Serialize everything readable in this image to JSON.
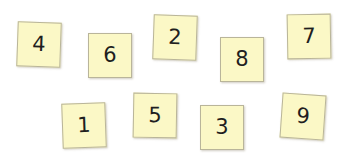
{
  "colors": {
    "card_fill": "#fbf8c6",
    "card_border": "#b9b59a",
    "digit": "#1f1f1f",
    "background": "#ffffff"
  },
  "cards": [
    {
      "label": "4",
      "x": 17,
      "y": 22,
      "rotate": 2
    },
    {
      "label": "6",
      "x": 88,
      "y": 33,
      "rotate": 0
    },
    {
      "label": "2",
      "x": 153,
      "y": 15,
      "rotate": 2
    },
    {
      "label": "8",
      "x": 220,
      "y": 37,
      "rotate": 0
    },
    {
      "label": "7",
      "x": 287,
      "y": 14,
      "rotate": -1
    },
    {
      "label": "1",
      "x": 62,
      "y": 103,
      "rotate": -2
    },
    {
      "label": "5",
      "x": 133,
      "y": 93,
      "rotate": 1
    },
    {
      "label": "3",
      "x": 200,
      "y": 105,
      "rotate": 0
    },
    {
      "label": "9",
      "x": 281,
      "y": 94,
      "rotate": 4
    }
  ]
}
